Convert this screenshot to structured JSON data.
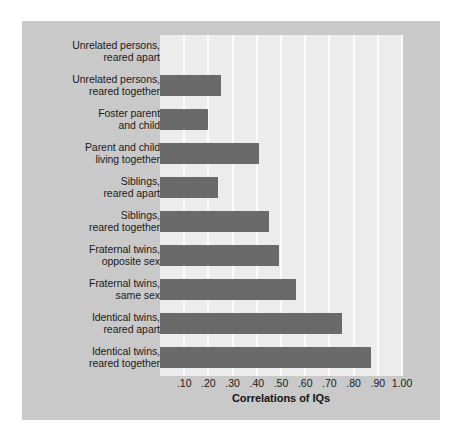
{
  "figure": {
    "panel_background": "#c9c9c9",
    "page_background": "#ffffff",
    "plot_background": "#ececec",
    "bar_color": "#6a6a6a",
    "gridline_color": "#fbfbfb",
    "text_color": "#1b1b1b"
  },
  "chart_data": {
    "type": "bar",
    "orientation": "horizontal",
    "title": "",
    "xlabel": "Correlations of IQs",
    "ylabel": "",
    "xlim": [
      0,
      1.0
    ],
    "grid": true,
    "legend": null,
    "xticks": [
      0.1,
      0.2,
      0.3,
      0.4,
      0.5,
      0.6,
      0.7,
      0.8,
      0.9,
      1.0
    ],
    "xtick_labels": [
      ".10",
      ".20",
      ".30",
      ".40",
      ".50",
      ".60",
      ".70",
      ".80",
      ".90",
      "1.00"
    ],
    "categories": [
      "Unrelated persons,\nreared apart",
      "Unrelated persons,\nreared together",
      "Foster parent\nand child",
      "Parent and child\nliving together",
      "Siblings,\nreared apart",
      "Siblings,\nreared together",
      "Fraternal twins,\nopposite sex",
      "Fraternal twins,\nsame sex",
      "Identical twins,\nreared apart",
      "Identical twins,\nreared together"
    ],
    "values": [
      0.0,
      0.25,
      0.2,
      0.41,
      0.24,
      0.45,
      0.49,
      0.56,
      0.75,
      0.87
    ]
  }
}
